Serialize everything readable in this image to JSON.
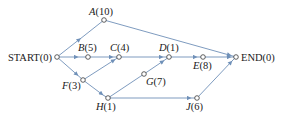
{
  "diagram": {
    "type": "activity-network",
    "edge_color": "#6f90b8",
    "nodes": [
      {
        "id": "START",
        "name": "START",
        "duration": "0",
        "label": "START(0)",
        "x": 57,
        "y": 57
      },
      {
        "id": "A",
        "name": "A",
        "duration": "10",
        "label": "A(10)",
        "x": 104,
        "y": 20
      },
      {
        "id": "B",
        "name": "B",
        "duration": "5",
        "label": "B(5)",
        "x": 88,
        "y": 57
      },
      {
        "id": "C",
        "name": "C",
        "duration": "4",
        "label": "C(4)",
        "x": 119,
        "y": 57
      },
      {
        "id": "D",
        "name": "D",
        "duration": "1",
        "label": "D(1)",
        "x": 169,
        "y": 57
      },
      {
        "id": "E",
        "name": "E",
        "duration": "8",
        "label": "E(8)",
        "x": 203,
        "y": 57
      },
      {
        "id": "END",
        "name": "END",
        "duration": "0",
        "label": "END(0)",
        "x": 236,
        "y": 57
      },
      {
        "id": "F",
        "name": "F",
        "duration": "3",
        "label": "F(3)",
        "x": 83,
        "y": 80
      },
      {
        "id": "G",
        "name": "G",
        "duration": "7",
        "label": "G(7)",
        "x": 144,
        "y": 74
      },
      {
        "id": "H",
        "name": "H",
        "duration": "1",
        "label": "H(1)",
        "x": 108,
        "y": 98
      },
      {
        "id": "J",
        "name": "J",
        "duration": "6",
        "label": "J(6)",
        "x": 197,
        "y": 98
      }
    ],
    "edges": [
      {
        "from": "START",
        "to": "A"
      },
      {
        "from": "START",
        "to": "B"
      },
      {
        "from": "START",
        "to": "F"
      },
      {
        "from": "B",
        "to": "C"
      },
      {
        "from": "C",
        "to": "D"
      },
      {
        "from": "F",
        "to": "C"
      },
      {
        "from": "F",
        "to": "H"
      },
      {
        "from": "H",
        "to": "G"
      },
      {
        "from": "G",
        "to": "D"
      },
      {
        "from": "H",
        "to": "J"
      },
      {
        "from": "D",
        "to": "E"
      },
      {
        "from": "E",
        "to": "END"
      },
      {
        "from": "A",
        "to": "END"
      },
      {
        "from": "J",
        "to": "END"
      }
    ]
  }
}
